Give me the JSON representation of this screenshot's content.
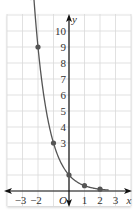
{
  "chart_data": {
    "type": "line",
    "title": "",
    "function": "y = (1/3)^x",
    "xlabel": "x",
    "ylabel": "y",
    "origin_label": "O",
    "xlim": [
      -4,
      4
    ],
    "ylim": [
      -1,
      11
    ],
    "grid": true,
    "x_ticks": [
      "-3",
      "-2",
      "1",
      "2",
      "3"
    ],
    "x_tick_values": [
      -3,
      -2,
      1,
      2,
      3
    ],
    "y_ticks": [
      "3",
      "4",
      "5",
      "6",
      "7",
      "8",
      "9",
      "10"
    ],
    "y_tick_values": [
      3,
      4,
      5,
      6,
      7,
      8,
      9,
      10
    ],
    "points": [
      {
        "x": -2,
        "y": 9
      },
      {
        "x": -1,
        "y": 3
      },
      {
        "x": 0,
        "y": 1
      },
      {
        "x": 1,
        "y": 0.333
      },
      {
        "x": 2,
        "y": 0.111
      }
    ],
    "series": [
      {
        "name": "y = (1/3)^x",
        "color": "#555555"
      }
    ]
  },
  "colors": {
    "grid": "#d9d9d9",
    "axis": "#111111",
    "curve": "#555555",
    "point": "#555555"
  }
}
